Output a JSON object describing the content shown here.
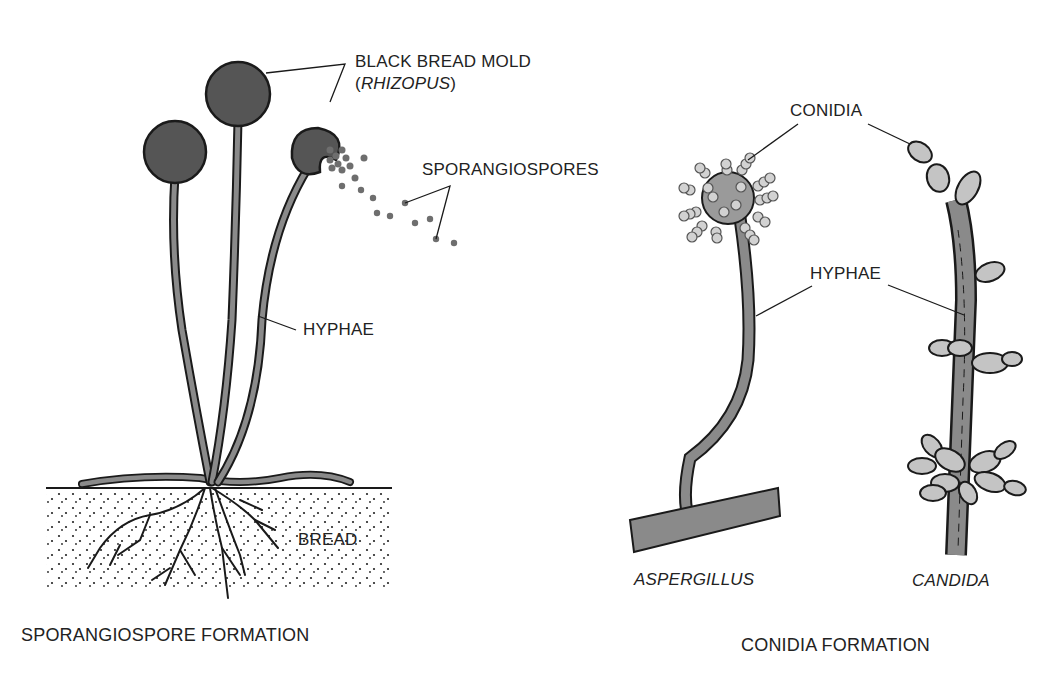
{
  "diagram": {
    "left_panel": {
      "caption": "SPORANGIOSPORE FORMATION",
      "labels": {
        "organism_line1": "BLACK BREAD MOLD",
        "organism_line2_open": "(",
        "organism_line2_italic": "RHIZOPUS",
        "organism_line2_close": ")",
        "spores": "SPORANGIOSPORES",
        "hyphae": "HYPHAE",
        "substrate": "BREAD"
      }
    },
    "right_panel": {
      "caption": "CONIDIA FORMATION",
      "labels": {
        "conidia": "CONIDIA",
        "hyphae": "HYPHAE",
        "organism_a": "ASPERGILLUS",
        "organism_b": "CANDIDA"
      }
    },
    "colors": {
      "outline": "#1a1a1a",
      "sporangium_fill": "#555555",
      "hypha_fill": "#8a8a8a",
      "conidia_fill": "#c4c4c4",
      "spore_dot": "#6e6e6e",
      "text": "#222222"
    }
  }
}
